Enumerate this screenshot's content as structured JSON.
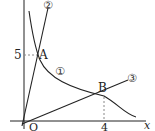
{
  "diagram": {
    "axes": {
      "x_label": "x",
      "origin_label": "O",
      "y_tick_label": "5",
      "x_tick_label": "4"
    },
    "points": [
      {
        "id": "A",
        "label": "A",
        "x": null,
        "y": 5
      },
      {
        "id": "B",
        "label": "B",
        "x": 4,
        "y": null
      }
    ],
    "curves": [
      {
        "id": "1",
        "label": "①",
        "type": "hyperbola-decreasing"
      },
      {
        "id": "2",
        "label": "②",
        "type": "line-steep"
      },
      {
        "id": "3",
        "label": "③",
        "type": "line-shallow"
      }
    ],
    "colors": {
      "stroke": "#222222",
      "dashed": "#888888",
      "background": "#ffffff"
    }
  }
}
